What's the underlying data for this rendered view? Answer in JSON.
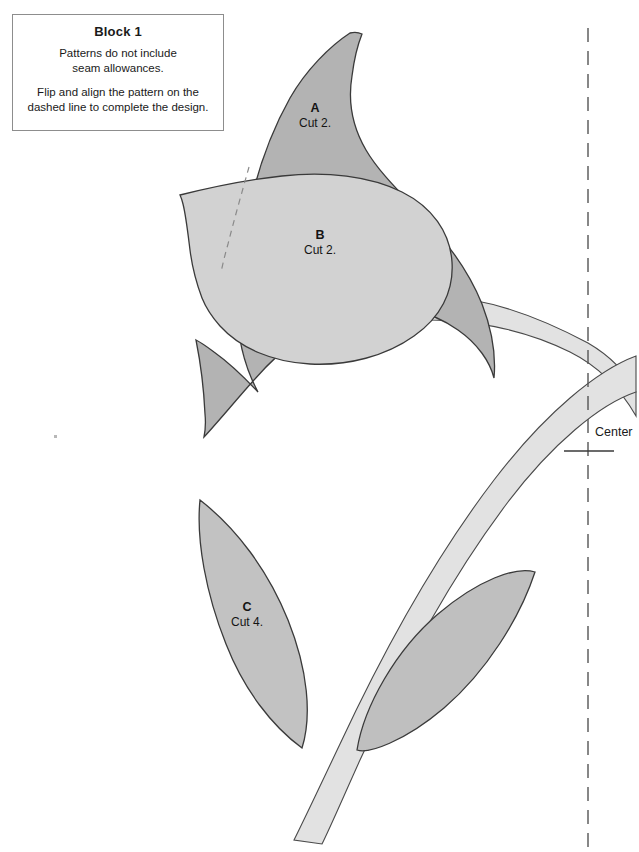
{
  "sheet": {
    "width": 639,
    "height": 852,
    "background": "#ffffff"
  },
  "instruction_box": {
    "title": "Block 1",
    "paragraph_1_line_1": "Patterns do not include",
    "paragraph_1_line_2": "seam allowances.",
    "paragraph_2_line_1": "Flip and align the pattern on the",
    "paragraph_2_line_2": "dashed line to complete the design.",
    "border_color": "#8d8d8d"
  },
  "pieces": [
    {
      "id": "A",
      "letter": "A",
      "cut": "Cut 2.",
      "fill": "#b3b3b3",
      "stroke": "#3a3a3a",
      "description": "large-petal-back"
    },
    {
      "id": "B",
      "letter": "B",
      "cut": "Cut 2.",
      "fill": "#d2d2d2",
      "stroke": "#3a3a3a",
      "description": "petal-front"
    },
    {
      "id": "C",
      "letter": "C",
      "cut": "Cut 4.",
      "fill": "#c2c2c2",
      "stroke": "#3a3a3a",
      "description": "leaf"
    }
  ],
  "stem": {
    "fill": "#e2e2e2",
    "stroke": "#4a4a4a",
    "description": "curved-stem-band"
  },
  "leaves": {
    "left_leaf_fill": "#c2c2c2",
    "right_leaf_fill": "#bfbfbf",
    "stroke": "#3a3a3a"
  },
  "center_marker": {
    "label": "Center",
    "line_style": "dashed",
    "line_color": "#555555",
    "tick_y": 451,
    "dash_x": 588
  },
  "colors": {
    "ink": "#1a1a1a",
    "outline": "#3a3a3a",
    "dark_gray_fill": "#b3b3b3",
    "mid_gray_fill": "#c2c2c2",
    "light_gray_fill": "#d2d2d2",
    "pale_gray_fill": "#e2e2e2"
  }
}
